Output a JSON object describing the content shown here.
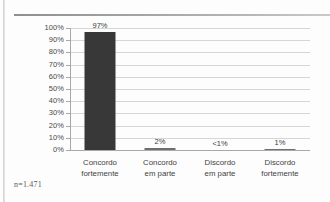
{
  "decorations": {
    "top_rule": "horizontal-rule",
    "left_edge": "page-scan-edge"
  },
  "footnote": {
    "text": "n=1.471"
  },
  "chart_data": {
    "type": "bar",
    "title": "",
    "subtitle": "",
    "xlabel": "",
    "ylabel": "",
    "categories": [
      "Concordo fortemente",
      "Concordo em parte",
      "Discordo em parte",
      "Discordo fortemente"
    ],
    "category_lines": [
      [
        "Concordo",
        "fortemente"
      ],
      [
        "Concordo",
        "em parte"
      ],
      [
        "Discordo",
        "em parte"
      ],
      [
        "Discordo",
        "fortemente"
      ]
    ],
    "values": [
      97,
      2,
      0.4,
      1
    ],
    "data_labels": [
      "97%",
      "2%",
      "<1%",
      "1%"
    ],
    "ylim": [
      0,
      100
    ],
    "ytick_values": [
      0,
      10,
      20,
      30,
      40,
      50,
      60,
      70,
      80,
      90,
      100
    ],
    "ytick_labels": [
      "0%",
      "10%",
      "20%",
      "30%",
      "40%",
      "50%",
      "60%",
      "70%",
      "80%",
      "90%",
      "100%"
    ],
    "grid": true,
    "grid_axis": "y",
    "legend": false,
    "bar_color": "#383838",
    "grid_color": "#d6d6d6",
    "axis_color": "#a8a8a8",
    "label_color": "#3c3c3c",
    "background": "#ffffff"
  }
}
